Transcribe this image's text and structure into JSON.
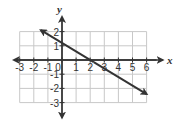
{
  "chart_data": {
    "type": "line",
    "title": "",
    "xlabel": "x",
    "ylabel": "y",
    "xlim": [
      -3,
      6
    ],
    "ylim": [
      -3,
      2
    ],
    "grid": true,
    "x_ticks": [
      "-3",
      "-2",
      "-1",
      "0",
      "1",
      "2",
      "3",
      "4",
      "5",
      "6"
    ],
    "y_ticks": [
      "2",
      "1",
      "-1",
      "-2",
      "-3"
    ],
    "series": [
      {
        "name": "line",
        "equation": "y = -3/5 x + 6/5",
        "x": [
          -1.5,
          6
        ],
        "y": [
          2.1,
          -2.4
        ],
        "arrows": "both",
        "color": "#333333"
      }
    ]
  },
  "colors": {
    "grid": "#c8c8c8",
    "axis": "#333333",
    "line": "#333333"
  }
}
